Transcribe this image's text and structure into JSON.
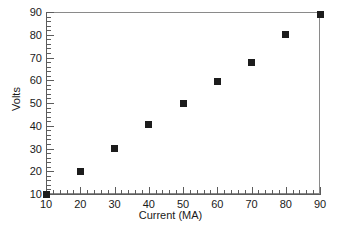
{
  "chart_data": {
    "type": "scatter",
    "title": "",
    "xlabel": "Current (MA)",
    "ylabel": "Volts",
    "xlim": [
      10,
      90
    ],
    "ylim": [
      10,
      90
    ],
    "xticks": [
      10,
      20,
      30,
      40,
      50,
      60,
      70,
      80,
      90
    ],
    "yticks": [
      10,
      20,
      30,
      40,
      50,
      60,
      70,
      80,
      90
    ],
    "xtick_labels": [
      "10",
      "20",
      "30",
      "40",
      "50",
      "60",
      "70",
      "80",
      "90"
    ],
    "ytick_labels": [
      "10",
      "20",
      "30",
      "40",
      "50",
      "60",
      "70",
      "80",
      "90"
    ],
    "minor_tick_interval": 2,
    "grid": false,
    "legend": null,
    "marker_style": "filled-square",
    "marker_color": "#1c1c1c",
    "axis_color": "#5c5c5c",
    "background_color": "#ffffff",
    "frame": "box",
    "x": [
      10,
      20,
      30,
      40,
      50,
      60,
      70,
      80,
      90
    ],
    "y": [
      10,
      20,
      30,
      40.5,
      50,
      59.5,
      68,
      80,
      89
    ],
    "series": [
      {
        "name": "Volts vs Current",
        "points": [
          {
            "x": 10,
            "y": 10
          },
          {
            "x": 20,
            "y": 20
          },
          {
            "x": 30,
            "y": 30
          },
          {
            "x": 40,
            "y": 40.5
          },
          {
            "x": 50,
            "y": 50
          },
          {
            "x": 60,
            "y": 59.5
          },
          {
            "x": 70,
            "y": 68
          },
          {
            "x": 80,
            "y": 80
          },
          {
            "x": 90,
            "y": 89
          }
        ]
      }
    ]
  }
}
